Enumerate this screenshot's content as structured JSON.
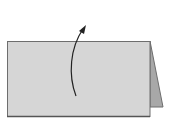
{
  "diagram": {
    "title": "",
    "description": "Folded tent card with a curved arrow indicating lifting/folding the front panel up",
    "elements": {
      "front_panel": {
        "shape": "rectangle",
        "fill": "#d6d6d6",
        "stroke": "#6e6e6e"
      },
      "back_flap": {
        "shape": "triangle",
        "fill": "#a8a8a8",
        "stroke": "#6e6e6e"
      },
      "arrow": {
        "type": "curved-arrow",
        "direction": "up",
        "color": "#222222"
      }
    }
  },
  "colors": {
    "background": "#ffffff",
    "panel_fill": "#d6d6d6",
    "flap_fill": "#a8a8a8",
    "outline": "#6e6e6e",
    "arrow": "#222222"
  }
}
